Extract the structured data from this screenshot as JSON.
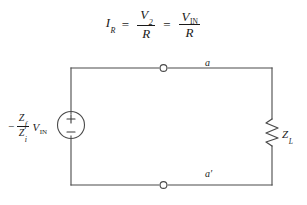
{
  "figure": {
    "type": "circuit-diagram-with-equation",
    "background_color": "#ffffff",
    "line_color": "#3a3a3a"
  },
  "equation": {
    "lhs_symbol": "I",
    "lhs_subscript": "R",
    "equals_1": "=",
    "term1_numerator_symbol": "V",
    "term1_numerator_subscript": "2",
    "term1_denominator": "R",
    "equals_2": "=",
    "term2_numerator_symbol": "V",
    "term2_numerator_subscript": "IN",
    "term2_denominator": "R",
    "plain_text": "I_R = V_2 / R = V_IN / R"
  },
  "circuit": {
    "source": {
      "symbol_name": "independent-voltage-source",
      "plus_sign": "+",
      "minus_sign": "−",
      "label": {
        "sign": "−",
        "numerator_symbol": "Z",
        "numerator_subscript": "f",
        "denominator_symbol": "Z",
        "denominator_subscript": "i",
        "multiplicand_symbol": "V",
        "multiplicand_subscript": "IN",
        "plain_text": "-(Z_f / Z_i) V_IN"
      }
    },
    "load": {
      "symbol_name": "resistor-zigzag",
      "label_symbol": "Z",
      "label_subscript": "L",
      "plain_text": "Z_L"
    },
    "terminals": [
      {
        "name": "terminal-a",
        "label": "a"
      },
      {
        "name": "terminal-a-prime",
        "label": "a",
        "prime": "′"
      }
    ]
  }
}
